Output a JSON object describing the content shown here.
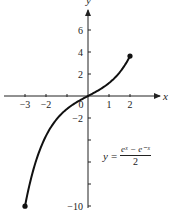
{
  "chart_data": {
    "type": "line",
    "title": "",
    "function": "y = (e^x - e^-x)/2",
    "equation_label": {
      "lhs": "y",
      "eq": "=",
      "numerator": "eˣ − e⁻ˣ",
      "denominator": "2"
    },
    "xlabel": "x",
    "ylabel": "y",
    "xlim": [
      -3.5,
      3.5
    ],
    "ylim": [
      -10.5,
      7.5
    ],
    "x_ticks": [
      -3,
      -2,
      -1,
      0,
      1,
      2
    ],
    "x_tick_labels": [
      "−3",
      "−2",
      "",
      "0",
      "1",
      "2"
    ],
    "y_ticks": [
      -10,
      -8,
      -6,
      -4,
      -2,
      2,
      4,
      6
    ],
    "y_tick_labels": [
      "−10",
      "",
      "",
      "",
      "−2",
      "2",
      "4",
      "6"
    ],
    "domain": [
      -3,
      2
    ],
    "endpoints": [
      {
        "x": -3,
        "y": -10.02
      },
      {
        "x": 2,
        "y": 3.63
      }
    ],
    "x": [
      -3,
      -2.5,
      -2,
      -1.5,
      -1,
      -0.5,
      0,
      0.5,
      1,
      1.5,
      2
    ],
    "values": [
      -10.02,
      -6.05,
      -3.63,
      -2.13,
      -1.18,
      -0.52,
      0,
      0.52,
      1.18,
      2.13,
      3.63
    ],
    "grid": false,
    "legend": null
  }
}
